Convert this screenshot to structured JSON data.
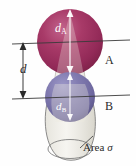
{
  "figure": {
    "background_color": "#fefefe"
  },
  "labels": {
    "diameter_a": {
      "symbol": "d",
      "subscript": "A",
      "text": "dA",
      "color": "#ffffff"
    },
    "diameter_b": {
      "symbol": "d",
      "subscript": "B",
      "text": "dB",
      "color": "#ffffff"
    },
    "separation": {
      "symbol": "d",
      "text": "d",
      "color": "#2b2b2b"
    },
    "molecule_a": {
      "text": "A",
      "color": "#2b2b2b"
    },
    "molecule_b": {
      "text": "B",
      "color": "#2b2b2b"
    },
    "area": {
      "text": "Area",
      "symbol": "σ",
      "color": "#2b2b2b"
    }
  },
  "spheres": {
    "sphere_a": {
      "name": "A",
      "center_x": 70,
      "center_y": 42,
      "radius": 33,
      "fill_center": "#b8537f",
      "fill_mid": "#9c3160",
      "fill_edge": "#7d2047"
    },
    "sphere_b": {
      "name": "B",
      "center_x": 70,
      "center_y": 97,
      "radius": 25,
      "fill_center": "#8f8abd",
      "fill_mid": "#7a74a8",
      "fill_edge": "#5d588c"
    }
  },
  "geometry": {
    "axis_line_top_y": 42,
    "axis_line_bottom_y": 97,
    "dimension_arrow_x": 23,
    "collision_area_color": "#e2e0d8",
    "collision_area_stroke": "#6e6e6e",
    "line_color": "#3a3a3a"
  }
}
